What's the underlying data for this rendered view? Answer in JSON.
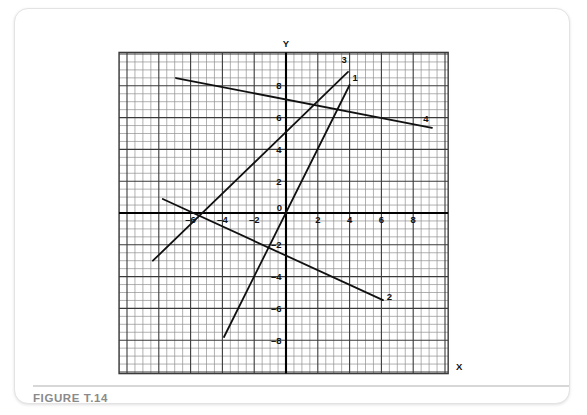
{
  "figure": {
    "caption": "FIGURE T.14",
    "axis_titles": {
      "x": "X",
      "y": "Y"
    },
    "colors": {
      "grid_minor": "#8f8f8f",
      "grid_major": "#3a3a3a",
      "axis": "#000000",
      "line": "#111111",
      "caption": "#8a8a8a",
      "card_border": "#e3e3e3",
      "background": "#ffffff"
    }
  },
  "chart_data": {
    "type": "line",
    "title": "FIGURE T.14",
    "xlabel": "X",
    "ylabel": "Y",
    "xlim": [
      -10.5,
      10.2
    ],
    "ylim": [
      -10.1,
      10.1
    ],
    "grid": true,
    "grid_minor_step": 0.5,
    "grid_major_step": 2,
    "legend": "inline-end-labels",
    "xticks": [
      -6,
      -4,
      -2,
      0,
      2,
      4,
      6,
      8
    ],
    "xticklabels": [
      "–6",
      "–4",
      "–2",
      "0",
      "2",
      "4",
      "6",
      "8"
    ],
    "yticks": [
      8,
      6,
      4,
      2,
      -2,
      -4,
      -6,
      -8
    ],
    "yticklabels": [
      "8",
      "6",
      "4",
      "2",
      "–2",
      "–4",
      "–6",
      "–8"
    ],
    "series": [
      {
        "name": "1",
        "label": "1",
        "x": [
          -3.9,
          4.0
        ],
        "y": [
          -7.8,
          8.05
        ],
        "slope": 2.0,
        "intercept": 0.0,
        "label_at": [
          4.35,
          8.3
        ]
      },
      {
        "name": "2",
        "label": "2",
        "x": [
          -7.75,
          6.1
        ],
        "y": [
          0.88,
          -5.48
        ],
        "slope": -0.46,
        "intercept": -2.68,
        "label_at": [
          6.5,
          -5.5
        ]
      },
      {
        "name": "3",
        "label": "3",
        "x": [
          -8.37,
          3.9
        ],
        "y": [
          -3.0,
          8.87
        ],
        "slope": 0.97,
        "intercept": 5.1,
        "label_at": [
          3.65,
          9.45
        ]
      },
      {
        "name": "4",
        "label": "4",
        "x": [
          -6.92,
          9.18
        ],
        "y": [
          8.49,
          5.35
        ],
        "slope": -0.195,
        "intercept": 7.14,
        "label_at": [
          8.8,
          5.75
        ]
      }
    ]
  }
}
